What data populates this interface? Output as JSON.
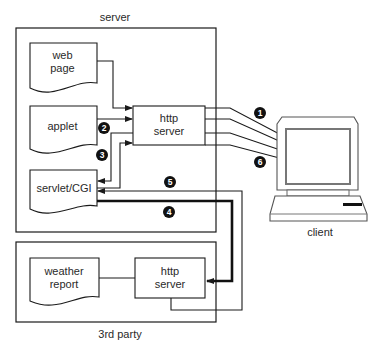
{
  "diagram": {
    "server_group": {
      "label": "server"
    },
    "third_party_group": {
      "label": "3rd party"
    },
    "client": {
      "label": "client"
    },
    "documents": {
      "web_page": "web\npage",
      "applet": "applet",
      "servlet": "servlet/CGI",
      "weather_report": "weather\nreport"
    },
    "servers": {
      "server_http": "http\nserver",
      "third_party_http": "http\nserver"
    },
    "steps": [
      "1",
      "2",
      "3",
      "4",
      "5",
      "6"
    ],
    "colors": {
      "line": "#1a1a1a",
      "badge": "#111111",
      "background": "#ffffff"
    }
  }
}
